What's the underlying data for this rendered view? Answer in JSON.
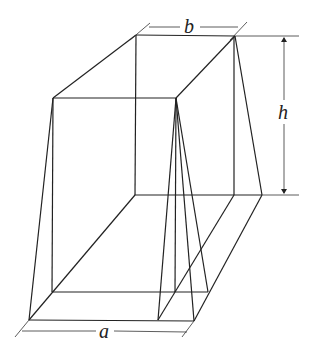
{
  "diagram": {
    "labels": {
      "a": "a",
      "b": "b",
      "h": "h"
    },
    "dimensions": [
      {
        "label": "a",
        "meaning": "base length (front edge)"
      },
      {
        "label": "b",
        "meaning": "top edge length"
      },
      {
        "label": "h",
        "meaning": "height"
      }
    ]
  }
}
